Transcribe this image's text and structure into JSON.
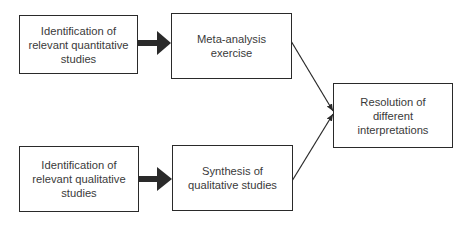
{
  "diagram": {
    "nodes": [
      {
        "id": "quant-id",
        "label": "Identification of\nrelevant quantitative\nstudies"
      },
      {
        "id": "meta",
        "label": "Meta-analysis\nexercise"
      },
      {
        "id": "resolution",
        "label": "Resolution of\ndifferent\ninterpretations"
      },
      {
        "id": "qual-id",
        "label": "Identification of\nrelevant qualitative\nstudies"
      },
      {
        "id": "synthesis",
        "label": "Synthesis of\nqualitative studies"
      }
    ],
    "edges": [
      {
        "from": "quant-id",
        "to": "meta",
        "style": "thick-arrow"
      },
      {
        "from": "qual-id",
        "to": "synthesis",
        "style": "thick-arrow"
      },
      {
        "from": "meta",
        "to": "resolution",
        "style": "thin-arrow"
      },
      {
        "from": "synthesis",
        "to": "resolution",
        "style": "thin-arrow"
      }
    ],
    "colors": {
      "stroke": "#2a2a2a",
      "text": "#3a3a3a",
      "background": "#ffffff"
    }
  }
}
